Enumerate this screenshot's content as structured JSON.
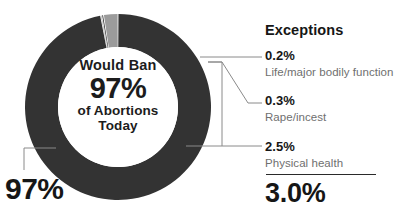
{
  "center": {
    "line1": "Would Ban",
    "line2": "97%",
    "line3": "of Abortions",
    "line4": "Today"
  },
  "left_callout": {
    "value": "97%"
  },
  "legend": {
    "title": "Exceptions",
    "rows": [
      {
        "value": "0.2%",
        "desc": "Life/major bodily function"
      },
      {
        "value": "0.3%",
        "desc": "Rape/incest"
      },
      {
        "value": "2.5%",
        "desc": "Physical health"
      }
    ],
    "total": "3.0%"
  },
  "colors": {
    "primary_dark": "#333333",
    "segment_gray": "#9b9b9b",
    "segment_sliver": "#4a4a4a",
    "text_dark": "#161616",
    "text_muted": "#6f6f6f",
    "leader_line": "#8a8a8a",
    "background": "#ffffff"
  },
  "chart_data": {
    "type": "pie",
    "title": "Would Ban 97% of Abortions Today",
    "subtitle": "Exceptions",
    "variant": "donut",
    "center_x": 118,
    "center_y": 107,
    "outer_radius": 93,
    "inner_radius": 60,
    "start_angle_deg": -90,
    "direction": "clockwise",
    "grid": false,
    "legend_position": "right",
    "total": 100,
    "labels": [
      "Would Ban",
      "Life/major bodily function",
      "Rape/incest",
      "Physical health"
    ],
    "values": [
      97,
      0.2,
      0.3,
      2.5
    ],
    "slices": [
      {
        "label": "Would Ban",
        "value": 97,
        "display": "97%",
        "color": "#333333"
      },
      {
        "label": "Life/major bodily function",
        "value": 0.2,
        "display": "0.2%",
        "color": "#4a4a4a"
      },
      {
        "label": "Rape/incest",
        "value": 0.3,
        "display": "0.3%",
        "color": "#333333"
      },
      {
        "label": "Physical health",
        "value": 2.5,
        "display": "2.5%",
        "color": "#9b9b9b"
      }
    ],
    "annotations": [
      {
        "text": "97%",
        "target": "Would Ban",
        "position": "bottom-left"
      },
      {
        "text": "3.0%",
        "target": "exceptions-total",
        "position": "bottom-right"
      }
    ],
    "exceptions_total": 3.0,
    "xlabel": "",
    "ylabel": ""
  }
}
